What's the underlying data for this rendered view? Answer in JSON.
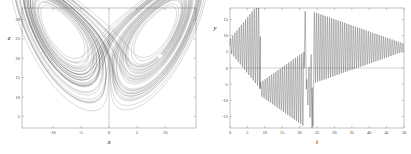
{
  "figure": {
    "title": "",
    "background_color": "#ffffff",
    "line_color": "#1a1a1a",
    "frame_color": "#9a9a9a",
    "grid_color": "#c8c8c8"
  },
  "chart_data": [
    {
      "type": "line",
      "name": "lorenz-phase-portrait",
      "title": "",
      "xlabel": "x",
      "ylabel": "z",
      "xlim": [
        -15.5,
        15.5
      ],
      "ylim": [
        2.0,
        33.0
      ],
      "xticks": [
        -10,
        -5,
        0,
        5,
        10
      ],
      "xtick_labels": [
        "-10",
        "-5",
        "0",
        "5",
        "10"
      ],
      "yticks": [
        5,
        10,
        15,
        20,
        25,
        30
      ],
      "ytick_labels": [
        "5",
        "10",
        "15",
        "20",
        "25",
        "30"
      ],
      "grid": false,
      "legend": "none",
      "description": "Lorenz attractor butterfly in the x-z plane; left lobe traced by a thin outward-spiralling set of orbits, right lobe densely filled with many revolutions and a small unfilled hole at the unstable fixed point near (9.1, 20.5)",
      "annotations": [
        {
          "label": "left-lobe-center",
          "x": -9.1,
          "y": 20.5
        },
        {
          "label": "right-lobe-center",
          "x": 9.1,
          "y": 20.5
        },
        {
          "label": "origin-vertical-line",
          "x": 0,
          "y": null
        }
      ],
      "series": [
        {
          "name": "trajectory",
          "color": "#1a1a1a",
          "linewidth": 0.35,
          "n_points": 20000,
          "params": {
            "sigma": 10,
            "rho": 28,
            "beta": 2.6667,
            "x0": 0.6,
            "y0": 0.6,
            "z0": 21.0,
            "dt": 0.0025
          }
        }
      ]
    },
    {
      "type": "line",
      "name": "lorenz-y-time-series",
      "title": "",
      "xlabel": "t",
      "ylabel": "y",
      "xlim": [
        0,
        50
      ],
      "ylim": [
        -18.5,
        18.5
      ],
      "xticks": [
        0,
        5,
        10,
        15,
        20,
        25,
        30,
        35,
        40,
        45,
        50
      ],
      "xtick_labels": [
        "0",
        "5",
        "10",
        "15",
        "20",
        "25",
        "30",
        "35",
        "40",
        "45",
        "50"
      ],
      "yticks": [
        -15,
        -10,
        -5,
        0,
        5,
        10,
        15
      ],
      "ytick_labels": [
        "-15",
        "-10",
        "-5",
        "0",
        "5",
        "10",
        "15"
      ],
      "grid": false,
      "legend": "none",
      "description": "y component versus time: growing positive-lobe oscillations from t=0 to t≈8.7, a jump to negative-lobe oscillations from t≈8.7 to t≈22.6 with a brief positive spike near t≈21.5, a deep excursion near t≈23.5, then sustained positive-lobe oscillations from t≈24 to t=50 whose envelope decays toward y≈6",
      "zero_line": 0,
      "series": [
        {
          "name": "y(t)",
          "color": "#1a1a1a",
          "linewidth": 0.35,
          "segments": [
            {
              "t_start": 0.0,
              "t_end": 8.7,
              "lobe": "positive",
              "env_start": 2.0,
              "env_end": 13.5,
              "center": 7.0,
              "period": 0.62
            },
            {
              "t_start": 8.7,
              "t_end": 21.3,
              "lobe": "negative",
              "env_start": 2.0,
              "env_end": 11.5,
              "center": -6.5,
              "period": 0.62
            },
            {
              "t_start": 21.3,
              "t_end": 21.9,
              "lobe": "spike-positive",
              "peak": 17.5
            },
            {
              "t_start": 21.9,
              "t_end": 23.6,
              "lobe": "negative",
              "env_start": 2.0,
              "env_end": 12.5,
              "center": -6.5,
              "period": 0.62
            },
            {
              "t_start": 23.6,
              "t_end": 24.1,
              "lobe": "deep-negative",
              "peak": -18.0
            },
            {
              "t_start": 24.1,
              "t_end": 50.0,
              "lobe": "positive-decaying",
              "env_start": 11.0,
              "env_end": 1.2,
              "center": 6.3,
              "period": 0.62
            }
          ]
        }
      ]
    }
  ],
  "panels": [
    {
      "id": "left",
      "axis_labels": {
        "x": "x",
        "y": "z"
      },
      "x_tick_labels": [
        "-10",
        "-5",
        "0",
        "5",
        "10"
      ],
      "y_tick_labels": [
        "5",
        "10",
        "15",
        "20",
        "25",
        "30"
      ]
    },
    {
      "id": "right",
      "axis_labels": {
        "x": "t",
        "y": "y"
      },
      "x_tick_labels": [
        "0",
        "5",
        "10",
        "15",
        "20",
        "25",
        "30",
        "35",
        "40",
        "45",
        "50"
      ],
      "y_tick_labels": [
        "-15",
        "-10",
        "-5",
        "0",
        "5",
        "10",
        "15"
      ]
    }
  ]
}
